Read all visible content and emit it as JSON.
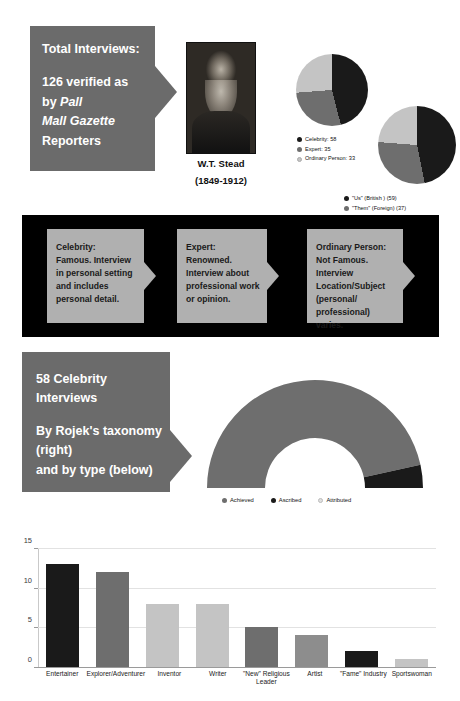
{
  "palette": {
    "dark": "#1a1a1a",
    "mid": "#6e6e6e",
    "light": "#c4c4c4",
    "panel_gray": "#6b6b6b",
    "card_gray": "#b0b0b0",
    "band_black": "#000000",
    "white": "#ffffff"
  },
  "section1": {
    "title": "Total Interviews:",
    "line1": "126 verified as",
    "line2_prefix": "by ",
    "line2_italic": "Pall",
    "line3_italic": "Mall Gazette",
    "line4": "Reporters",
    "portrait": {
      "name": "W.T. Stead",
      "years": "(1849-1912)"
    },
    "pie1": {
      "type": "pie",
      "title": "Interview subject type",
      "categories": [
        "Celebrity",
        "Expert",
        "Ordinary Person"
      ],
      "values": [
        58,
        35,
        33
      ],
      "colors": [
        "#1a1a1a",
        "#6e6e6e",
        "#c4c4c4"
      ],
      "legend": [
        "Celebrity: 58",
        "Expert: 35",
        "Ordinary Person: 33"
      ]
    },
    "pie2": {
      "type": "pie",
      "title": "Us / Them framing",
      "categories": [
        "\"Us\" (British )",
        "\"Them\" (Foreign)",
        "\"Us\" discussing \"Them\""
      ],
      "values": [
        59,
        37,
        30
      ],
      "colors": [
        "#1a1a1a",
        "#6e6e6e",
        "#c4c4c4"
      ],
      "legend": [
        "\"Us\" (British ) (59)",
        "\"Them\" (Foreign) (37)",
        "\"Us\" discussing \"Them\" (30)"
      ]
    }
  },
  "section2": {
    "cards": [
      {
        "heading": "Celebrity:",
        "body": "Famous. Interview in personal setting and includes personal detail."
      },
      {
        "heading": "Expert:",
        "body": "Renowned. Interview about professional work or opinion."
      },
      {
        "heading": "Ordinary Person:",
        "body": "Not Famous. Interview Location/Subject (personal/ professional) varies."
      }
    ]
  },
  "section3": {
    "line1": "58 Celebrity",
    "line2": "Interviews",
    "line3": "By Rojek's taxonomy",
    "line4": "(right)",
    "line5": "and by type (below)",
    "donut": {
      "type": "pie",
      "title": "58 Celebrity Interviews by Rojek's taxonomy",
      "shape": "half-donut",
      "categories": [
        "Achieved",
        "Ascribed",
        "Attributed"
      ],
      "values": [
        54,
        4,
        0
      ],
      "colors": [
        "#6e6e6e",
        "#1a1a1a",
        "#e0e0e0"
      ],
      "legend": [
        "Achieved",
        "Ascribed",
        "Attributed"
      ]
    }
  },
  "chart_data": {
    "type": "bar",
    "categories": [
      "Entertainer",
      "Explorer/Adventurer",
      "Inventor",
      "Writer",
      "\"New\" Religious Leader",
      "Artist",
      "\"Fame\" Industry",
      "Sportswoman"
    ],
    "values": [
      13,
      12,
      8,
      8,
      5,
      4,
      2,
      1
    ],
    "bar_colors": [
      "#1a1a1a",
      "#6e6e6e",
      "#c4c4c4",
      "#c4c4c4",
      "#6e6e6e",
      "#8d8d8d",
      "#1a1a1a",
      "#c4c4c4"
    ],
    "xlabel": "",
    "ylabel": "",
    "ylim": [
      0,
      15
    ],
    "yticks": [
      0,
      5,
      10,
      15
    ],
    "grid": true,
    "legend": "none"
  }
}
